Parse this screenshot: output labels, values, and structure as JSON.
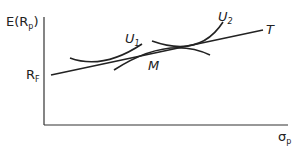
{
  "diagram": {
    "y_axis_label": "E(R",
    "y_axis_sub": "p",
    "y_axis_close": ")",
    "x_axis_label": "σ",
    "x_axis_sub": "p",
    "rf_label": "R",
    "rf_sub": "F",
    "line_label": "T",
    "market_label": "M",
    "curve1_label": "U",
    "curve1_sub": "1",
    "curve2_label": "U",
    "curve2_sub": "2",
    "stroke_color": "#222222"
  }
}
